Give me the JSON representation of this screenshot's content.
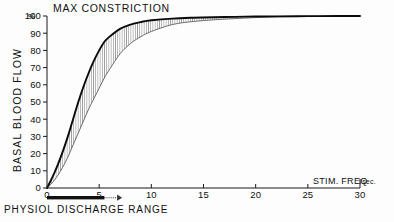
{
  "figure": {
    "background_color": "#fdfdfd",
    "ink_color": "#111111"
  },
  "chart_data": {
    "type": "line",
    "title": "MAX CONSTRICTION",
    "xlabel": "STIM. FREQ /sec.",
    "ylabel": "BASAL BLOOD FLOW",
    "yunit": "%",
    "xlim": [
      0,
      30
    ],
    "ylim": [
      0,
      100
    ],
    "grid": false,
    "legend": "none",
    "xticks": [
      0,
      5,
      10,
      15,
      20,
      25,
      30
    ],
    "xtick_labels": [
      "0",
      "5",
      "10",
      "15",
      "20",
      "25",
      "30"
    ],
    "yticks": [
      0,
      10,
      20,
      30,
      40,
      50,
      60,
      70,
      80,
      90,
      100
    ],
    "ytick_labels": [
      "0",
      "10",
      "20",
      "30",
      "40",
      "50",
      "60",
      "70",
      "80",
      "90",
      "100"
    ],
    "series": [
      {
        "name": "upper response curve",
        "style": "solid thick black sigmoid",
        "x": [
          0,
          0.5,
          1,
          1.5,
          2,
          2.5,
          3,
          3.5,
          4,
          4.5,
          5,
          5.5,
          6,
          7,
          8,
          9,
          10,
          12,
          14,
          16,
          18,
          20,
          22,
          25,
          28,
          30
        ],
        "values": [
          0,
          6,
          13,
          21,
          30,
          40,
          50,
          59,
          67,
          74,
          80,
          85,
          88,
          92.5,
          95,
          96.5,
          97.5,
          98.5,
          99,
          99.3,
          99.5,
          99.7,
          99.8,
          99.9,
          100,
          100
        ]
      },
      {
        "name": "lower response curve",
        "style": "thin grey sigmoid, lower bound of hatched band",
        "x": [
          0,
          0.5,
          1,
          1.5,
          2,
          2.5,
          3,
          3.5,
          4,
          4.5,
          5,
          5.5,
          6,
          7,
          8,
          9,
          10,
          12,
          14,
          16,
          18,
          20,
          22,
          25,
          28,
          30
        ],
        "values": [
          0,
          3,
          7,
          12,
          18,
          25,
          32,
          39,
          46,
          52,
          58,
          64,
          69,
          78,
          84,
          88,
          91,
          95,
          96.8,
          97.8,
          98.5,
          99.1,
          99.5,
          99.8,
          100,
          100
        ]
      }
    ],
    "band": {
      "name": "hatched variability band",
      "fill": "vertical line hatching",
      "between": [
        "upper response curve",
        "lower response curve"
      ]
    },
    "annotations": [
      {
        "name": "max-constriction-label",
        "text": "MAX CONSTRICTION",
        "position": "top, above 100% level"
      },
      {
        "name": "physiol-discharge-range",
        "text": "PHYSIOL DISCHARGE RANGE",
        "bar_start": 0,
        "bar_end": 5.5,
        "arrow_end": 7.2,
        "position": "below x-axis"
      }
    ]
  },
  "labels": {
    "max_constriction": "MAX CONSTRICTION",
    "y_axis": "BASAL BLOOD FLOW",
    "y_unit": "%",
    "x_axis_main": "STIM. FREQ",
    "x_axis_unit": "/sec.",
    "discharge_range": "PHYSIOL  DISCHARGE  RANGE"
  }
}
